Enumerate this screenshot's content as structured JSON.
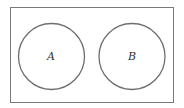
{
  "diagram": {
    "type": "venn",
    "universe": {
      "label": "",
      "x": 10,
      "y": 7,
      "width": 164,
      "height": 96,
      "stroke": "#7a7a7a"
    },
    "sets": [
      {
        "label": "A",
        "cx": 51.5,
        "cy": 56.5,
        "r": 33,
        "stroke": "#6e6e6e"
      },
      {
        "label": "B",
        "cx": 132,
        "cy": 56.5,
        "r": 33,
        "stroke": "#6e6e6e"
      }
    ],
    "relationship": "disjoint"
  }
}
